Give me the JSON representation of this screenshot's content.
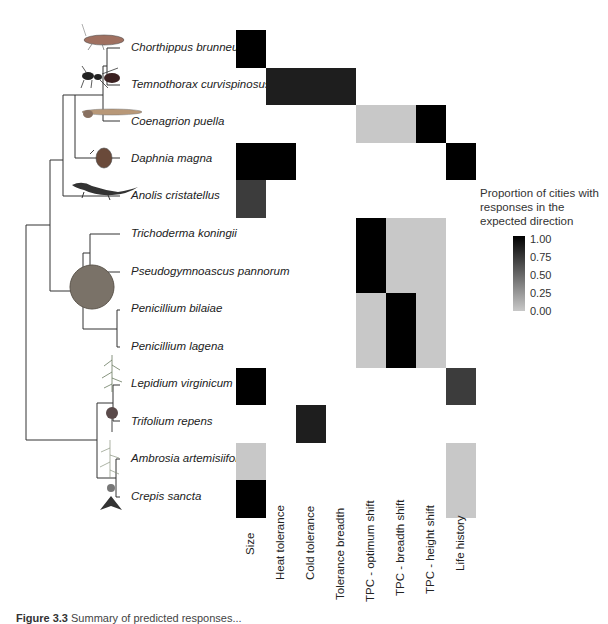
{
  "chart_data": {
    "type": "heatmap",
    "title": "",
    "rows": [
      "Chorthippus brunneus",
      "Temnothorax curvispinosus",
      "Coenagrion puella",
      "Daphnia magna",
      "Anolis cristatellus",
      "Trichoderma koningii",
      "Pseudogymnoascus pannorum",
      "Penicillium bilaiae",
      "Penicillium lagena",
      "Lepidium virginicum",
      "Trifolium repens",
      "Ambrosia artemisiifolia",
      "Crepis sancta"
    ],
    "columns": [
      "Size",
      "Heat tolerance",
      "Cold tolerance",
      "Tolerance  breadth",
      "TPC - optimum shift",
      "TPC - breadth shift",
      "TPC - height shift",
      "Life history"
    ],
    "values": [
      [
        1.0,
        null,
        null,
        null,
        null,
        null,
        null,
        null
      ],
      [
        null,
        0.85,
        0.85,
        0.85,
        null,
        null,
        null,
        null
      ],
      [
        null,
        null,
        null,
        null,
        0.0,
        0.0,
        1.0,
        null
      ],
      [
        1.0,
        1.0,
        null,
        null,
        null,
        null,
        null,
        1.0
      ],
      [
        0.7,
        null,
        null,
        null,
        null,
        null,
        null,
        null
      ],
      [
        null,
        null,
        null,
        null,
        1.0,
        0.0,
        0.0,
        null
      ],
      [
        null,
        null,
        null,
        null,
        1.0,
        0.0,
        0.0,
        null
      ],
      [
        null,
        null,
        null,
        null,
        0.0,
        1.0,
        0.0,
        null
      ],
      [
        null,
        null,
        null,
        null,
        0.0,
        1.0,
        0.0,
        null
      ],
      [
        1.0,
        null,
        null,
        null,
        null,
        null,
        null,
        0.7
      ],
      [
        null,
        null,
        0.85,
        null,
        null,
        null,
        null,
        null
      ],
      [
        0.0,
        null,
        null,
        null,
        null,
        null,
        null,
        0.0
      ],
      [
        1.0,
        null,
        null,
        null,
        null,
        null,
        null,
        0.0
      ]
    ],
    "legend": {
      "title": "Proportion of cities with responses in the expected direction",
      "ticks": [
        "1.00",
        "0.75",
        "0.50",
        "0.25",
        "0.00"
      ],
      "range": [
        0,
        1
      ],
      "color_low": "#c8c8c8",
      "color_high": "#000000"
    },
    "xlabel": "",
    "ylabel": "",
    "grid": false
  },
  "species_labels": [
    "Chorthippus brunneus",
    "Temnothorax curvispinosus",
    "Coenagrion puella",
    "Daphnia magna",
    "Anolis cristatellus",
    "Trichoderma koningii",
    "Pseudogymnoascus pannorum",
    "Penicillium bilaiae",
    "Penicillium lagena",
    "Lepidium virginicum",
    "Trifolium repens",
    "Ambrosia artemisiifolia",
    "Crepis sancta"
  ],
  "column_labels": [
    "Size",
    "Heat tolerance",
    "Cold tolerance",
    "Tolerance  breadth",
    "TPC - optimum shift",
    "TPC - breadth shift",
    "TPC - height shift",
    "Life history"
  ],
  "legend": {
    "title": "Proportion of cities with responses in the expected direction",
    "ticks": [
      "1.00",
      "0.75",
      "0.50",
      "0.25",
      "0.00"
    ]
  },
  "caption": {
    "label": "Figure 3.3",
    "text": "Summary of predicted responses..."
  }
}
